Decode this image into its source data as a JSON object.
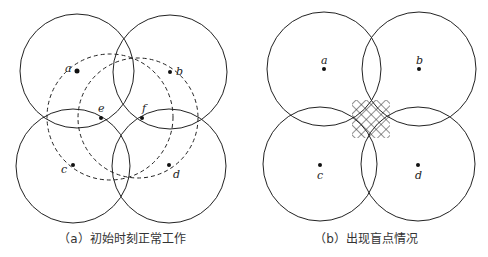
{
  "panels": [
    {
      "id": "a",
      "caption": "（a）初始时刻正常工作",
      "nodes": [
        {
          "label": "a"
        },
        {
          "label": "b"
        },
        {
          "label": "c"
        },
        {
          "label": "d"
        },
        {
          "label": "e"
        },
        {
          "label": "f"
        }
      ]
    },
    {
      "id": "b",
      "caption": "（b）出现盲点情况",
      "nodes": [
        {
          "label": "a"
        },
        {
          "label": "b"
        },
        {
          "label": "c"
        },
        {
          "label": "d"
        }
      ]
    }
  ]
}
